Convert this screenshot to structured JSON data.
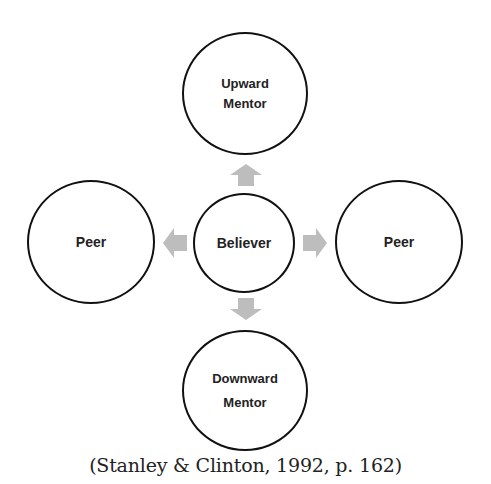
{
  "diagram": {
    "nodes": {
      "upward_mentor": {
        "line1": "Upward",
        "line2": "Mentor"
      },
      "peer_left": {
        "label": "Peer"
      },
      "believer": {
        "label": "Believer"
      },
      "peer_right": {
        "label": "Peer"
      },
      "downward_mentor": {
        "line1": "Downward",
        "line2": "Mentor"
      }
    },
    "arrows": [
      {
        "from": "Believer",
        "to": "Upward Mentor",
        "direction": "up"
      },
      {
        "from": "Believer",
        "to": "Peer",
        "direction": "left"
      },
      {
        "from": "Believer",
        "to": "Peer",
        "direction": "right"
      },
      {
        "from": "Believer",
        "to": "Downward Mentor",
        "direction": "down"
      }
    ],
    "colors": {
      "node_border": "#111111",
      "arrow_fill": "#bdbdbd",
      "text": "#222222"
    }
  },
  "caption": "(Stanley & Clinton, 1992, p. 162)"
}
